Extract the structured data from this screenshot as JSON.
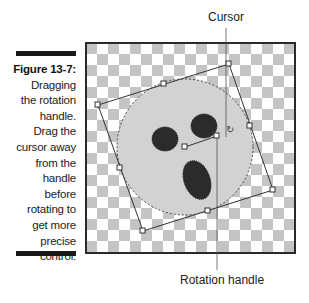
{
  "caption": {
    "figure_label": "Figure 13-7:",
    "lines": [
      "Dragging",
      "the rotation",
      "handle.",
      "Drag the",
      "cursor away",
      "from the",
      "handle",
      "before",
      "rotating to",
      "get more",
      "precise",
      "control."
    ]
  },
  "callouts": {
    "cursor": "Cursor",
    "rotation_handle": "Rotation handle"
  },
  "image": {
    "description": "Circular selection with three dark spots on a transparent checkerboard canvas, surrounded by a rotated bounding box with handles",
    "colors": {
      "checker_light": "#ffffff",
      "checker_dark": "#c4c4c4",
      "frame_border": "#2a2a2a",
      "circle_fill": "#d2d2d2",
      "spot_fill": "#2b2b2b",
      "box_line": "#333333"
    },
    "cursor_glyph": "↻"
  }
}
